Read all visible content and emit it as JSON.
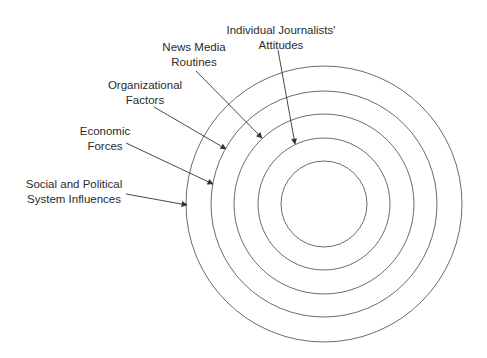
{
  "diagram": {
    "type": "concentric-circles",
    "colors": {
      "ring_stroke": "#5a5a5a",
      "arrow_stroke": "#333333",
      "text": "#2b2b2b",
      "background": "#ffffff"
    },
    "center": {
      "x": 324,
      "y": 204
    },
    "rings": [
      {
        "id": "ring-1",
        "radius": 138,
        "level": "Social and Political System Influences"
      },
      {
        "id": "ring-2",
        "radius": 113,
        "level": "Economic Forces"
      },
      {
        "id": "ring-3",
        "radius": 90,
        "level": "Organizational Factors"
      },
      {
        "id": "ring-4",
        "radius": 66,
        "level": "News Media Routines"
      },
      {
        "id": "ring-5",
        "radius": 43,
        "level": "Individual Journalists' Attitudes"
      }
    ],
    "labels": [
      {
        "id": "individual",
        "line1": "Individual Journalists'",
        "line2": "Attitudes",
        "x": 281,
        "y": 23,
        "arrow": {
          "x1": 278,
          "y1": 50,
          "x2": 295,
          "y2": 144
        }
      },
      {
        "id": "routines",
        "line1": "News Media",
        "line2": "Routines",
        "x": 194,
        "y": 40,
        "arrow": {
          "x1": 196,
          "y1": 71,
          "x2": 262,
          "y2": 138
        }
      },
      {
        "id": "organizational",
        "line1": "Organizational",
        "line2": "Factors",
        "x": 145,
        "y": 78,
        "arrow": {
          "x1": 154,
          "y1": 107,
          "x2": 226,
          "y2": 149
        }
      },
      {
        "id": "economic",
        "line1": "Economic",
        "line2": "Forces",
        "x": 105,
        "y": 124,
        "arrow": {
          "x1": 126,
          "y1": 143,
          "x2": 213,
          "y2": 184
        }
      },
      {
        "id": "social",
        "line1": "Social and Political",
        "line2": "System Influences",
        "x": 74,
        "y": 177,
        "arrow": {
          "x1": 126,
          "y1": 194,
          "x2": 187,
          "y2": 205
        }
      }
    ]
  }
}
